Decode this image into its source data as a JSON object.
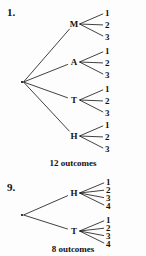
{
  "page": {
    "background_color": "#fdfdfd",
    "ink_color": "#111111"
  },
  "problems": [
    {
      "number": "1.",
      "root": {
        "x": 22,
        "y": 82
      },
      "branches": [
        {
          "label": "M",
          "x": 74,
          "y": 24,
          "leaves": [
            {
              "label": "1",
              "x": 105,
              "y": 13
            },
            {
              "label": "2",
              "x": 105,
              "y": 25
            },
            {
              "label": "3",
              "x": 105,
              "y": 37
            }
          ]
        },
        {
          "label": "A",
          "x": 74,
          "y": 62,
          "leaves": [
            {
              "label": "1",
              "x": 105,
              "y": 51
            },
            {
              "label": "2",
              "x": 105,
              "y": 63
            },
            {
              "label": "3",
              "x": 105,
              "y": 75
            }
          ]
        },
        {
          "label": "T",
          "x": 74,
          "y": 100,
          "leaves": [
            {
              "label": "1",
              "x": 105,
              "y": 89
            },
            {
              "label": "2",
              "x": 105,
              "y": 101
            },
            {
              "label": "3",
              "x": 105,
              "y": 113
            }
          ]
        },
        {
          "label": "H",
          "x": 74,
          "y": 136,
          "leaves": [
            {
              "label": "1",
              "x": 105,
              "y": 125
            },
            {
              "label": "2",
              "x": 105,
              "y": 137
            },
            {
              "label": "3",
              "x": 105,
              "y": 149
            }
          ]
        }
      ],
      "outcomes_text": "12 outcomes"
    },
    {
      "number": "9.",
      "root": {
        "x": 22,
        "y": 43
      },
      "branches": [
        {
          "label": "H",
          "x": 74,
          "y": 21,
          "leaves": [
            {
              "label": "1",
              "x": 106,
              "y": 10
            },
            {
              "label": "2",
              "x": 106,
              "y": 18
            },
            {
              "label": "3",
              "x": 106,
              "y": 26
            },
            {
              "label": "4",
              "x": 106,
              "y": 34
            }
          ]
        },
        {
          "label": "T",
          "x": 74,
          "y": 59,
          "leaves": [
            {
              "label": "1",
              "x": 106,
              "y": 48
            },
            {
              "label": "2",
              "x": 106,
              "y": 56
            },
            {
              "label": "3",
              "x": 106,
              "y": 64
            },
            {
              "label": "4",
              "x": 106,
              "y": 72
            }
          ]
        }
      ],
      "outcomes_text": "8 outcomes"
    }
  ]
}
